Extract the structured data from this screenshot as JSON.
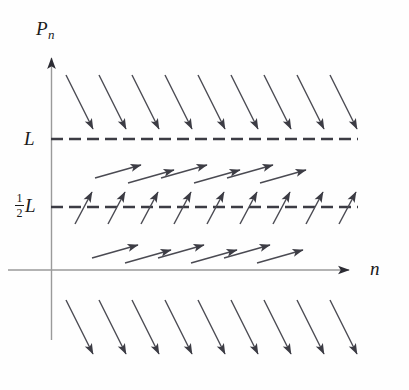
{
  "figure": {
    "name": "slope-field-logistic",
    "background_color": "#fefefe",
    "width": 409,
    "height": 390
  },
  "labels": {
    "y_axis": "P",
    "y_axis_subscript": "n",
    "x_axis": "n",
    "upper_line": "L",
    "lower_line_numerator": "1",
    "lower_line_denominator": "2",
    "lower_line_letter": "L"
  },
  "colors": {
    "axis": "#8a8a8a",
    "arrow": "#3c3c44",
    "dashed": "#3c3c44",
    "text": "#1a1a1a"
  },
  "chart_data": {
    "type": "scatter",
    "title": "",
    "xlabel": "n",
    "ylabel": "P_n",
    "grid": false,
    "legend": null,
    "axes": {
      "origin_px": [
        51,
        270
      ],
      "y_axis_top_px": 50,
      "x_axis_right_px": 356,
      "x_axis_label_px": [
        370,
        258
      ],
      "y_axis_label_px": [
        36,
        18
      ]
    },
    "reference_lines": [
      {
        "label": "L",
        "value": 1.0,
        "y_px": 139,
        "x_start_px": 51,
        "x_end_px": 358,
        "style": "dashed",
        "dash": [
          12,
          6
        ]
      },
      {
        "label": "1/2 L",
        "value": 0.5,
        "y_px": 207,
        "x_start_px": 51,
        "x_end_px": 358,
        "style": "dashed",
        "dash": [
          12,
          6
        ]
      }
    ],
    "arrow_bands": [
      {
        "name": "above-L-downward",
        "count": 9,
        "direction": "down-right",
        "dx": 27,
        "dy": 54,
        "x_start_px": 66,
        "x_step_px": 33,
        "y_tail_px": 75,
        "stagger_px": 0
      },
      {
        "name": "between-L-and-halfL-upper",
        "count": 6,
        "direction": "up-right",
        "dx": 46,
        "dy": -13,
        "x_start_px": 95,
        "x_step_px": 33,
        "y_tail_px": 178,
        "stagger_px": 5
      },
      {
        "name": "on-halfL-steep",
        "count": 9,
        "direction": "up-right-steep",
        "dx": 17,
        "dy": -32,
        "x_start_px": 75,
        "x_step_px": 33,
        "y_tail_px": 224,
        "stagger_px": 0
      },
      {
        "name": "below-halfL-lower",
        "count": 6,
        "direction": "up-right",
        "dx": 46,
        "dy": -13,
        "x_start_px": 92,
        "x_step_px": 33,
        "y_tail_px": 258,
        "stagger_px": 5
      },
      {
        "name": "below-axis-downward",
        "count": 9,
        "direction": "down-right",
        "dx": 27,
        "dy": 54,
        "x_start_px": 66,
        "x_step_px": 33,
        "y_tail_px": 300,
        "stagger_px": 0
      }
    ]
  }
}
